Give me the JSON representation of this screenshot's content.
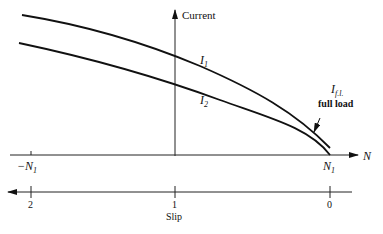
{
  "diagram": {
    "type": "induction-motor-current-vs-speed",
    "vertical_axis": {
      "label": "Current"
    },
    "speed_axis": {
      "label": "N",
      "ticks": [
        {
          "label": "−N",
          "sub": "1",
          "pos": "left"
        },
        {
          "label": "N",
          "sub": "1",
          "pos": "right"
        }
      ]
    },
    "slip_axis": {
      "label": "Slip",
      "ticks": [
        "2",
        "1",
        "0"
      ]
    },
    "curves": [
      {
        "name": "I",
        "sub": "1"
      },
      {
        "name": "I",
        "sub": "2"
      }
    ],
    "annotation": {
      "symbol": "I",
      "sub": "f.l.",
      "text": "full load"
    }
  }
}
